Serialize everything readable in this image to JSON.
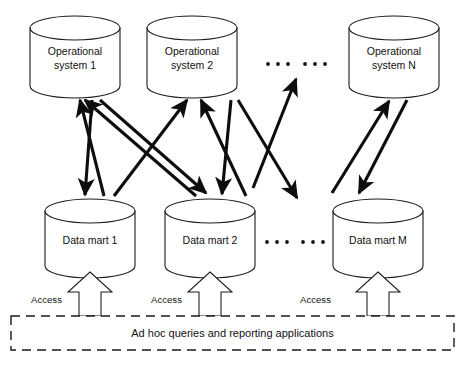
{
  "diagram": {
    "type": "architecture-diagram",
    "colors": {
      "stroke": "#1a1a1a",
      "arrow": "#0d0d0d",
      "fill": "#ffffff",
      "text": "#111111"
    },
    "operational_systems": [
      {
        "id": "os1",
        "label_line1": "Operational",
        "label_line2": "system 1",
        "cx": 75,
        "cy": 57
      },
      {
        "id": "os2",
        "label_line1": "Operational",
        "label_line2": "system 2",
        "cx": 192,
        "cy": 57
      },
      {
        "id": "osN",
        "label_line1": "Operational",
        "label_line2": "system N",
        "cx": 394,
        "cy": 57
      }
    ],
    "operational_ellipsis": {
      "label": ". . .   . . .",
      "groups": 2,
      "dots_per_group": 3
    },
    "data_marts": [
      {
        "id": "dm1",
        "label": "Data mart 1",
        "cx": 90,
        "cy": 240
      },
      {
        "id": "dm2",
        "label": "Data mart 2",
        "cx": 210,
        "cy": 240
      },
      {
        "id": "dmM",
        "label": "Data mart M",
        "cx": 378,
        "cy": 240
      }
    ],
    "data_mart_ellipsis": {
      "label": ". . .   . . .",
      "groups": 2,
      "dots_per_group": 3
    },
    "access_labels": [
      {
        "for": "dm1",
        "label": "Access"
      },
      {
        "for": "dm2",
        "label": "Access"
      },
      {
        "for": "dmM",
        "label": "Access"
      }
    ],
    "consumer_box": {
      "label": "Ad hoc queries and reporting applications",
      "style": "dashed"
    },
    "connectors": [
      {
        "from": "dm1",
        "to": "os1",
        "direction": "up"
      },
      {
        "from": "dm2",
        "to": "os1",
        "direction": "up"
      },
      {
        "from": "dm1",
        "to": "os2",
        "direction": "up"
      },
      {
        "from": "dm2",
        "to": "os2",
        "direction": "up"
      },
      {
        "from": "dm-mid",
        "to": "os-ellipsis",
        "direction": "up"
      },
      {
        "from": "dmM",
        "to": "osN",
        "direction": "up"
      },
      {
        "from": "os1",
        "to": "dm1",
        "direction": "down"
      },
      {
        "from": "os1",
        "to": "dm2",
        "direction": "down"
      },
      {
        "from": "os2",
        "to": "dm2",
        "direction": "down"
      },
      {
        "from": "os2",
        "to": "dm-right",
        "direction": "down"
      },
      {
        "from": "osN",
        "to": "dmM",
        "direction": "down"
      }
    ]
  }
}
